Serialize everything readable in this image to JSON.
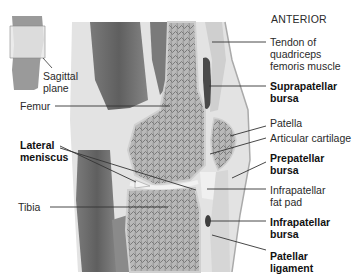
{
  "orientation_label": "ANTERIOR",
  "inset": {
    "label_line1": "Sagittal",
    "label_line2": "plane"
  },
  "left_labels": {
    "femur": "Femur",
    "lateral_meniscus_line1": "Lateral",
    "lateral_meniscus_line2": "meniscus",
    "tibia": "Tibia"
  },
  "right_labels": {
    "tendon_line1": "Tendon of",
    "tendon_line2": "quadriceps",
    "tendon_line3": "femoris muscle",
    "suprapatellar_line1": "Suprapatellar",
    "suprapatellar_line2": "bursa",
    "patella": "Patella",
    "articular_cartilage": "Articular cartilage",
    "prepatellar_line1": "Prepatellar",
    "prepatellar_line2": "bursa",
    "infrapatellar_fat_line1": "Infrapatellar",
    "infrapatellar_fat_line2": "fat pad",
    "infrapatellar_bursa_line1": "Infrapatellar",
    "infrapatellar_bursa_line2": "bursa",
    "patellar_ligament_line1": "Patellar",
    "patellar_ligament_line2": "ligament"
  },
  "colors": {
    "muscle_dark": "#6e6e6e",
    "muscle_mid": "#8c8c8c",
    "tissue_light": "#d9d9d9",
    "bone_fill": "#bdbdbd",
    "cartilage": "#ececec",
    "leader_line": "#333333"
  }
}
